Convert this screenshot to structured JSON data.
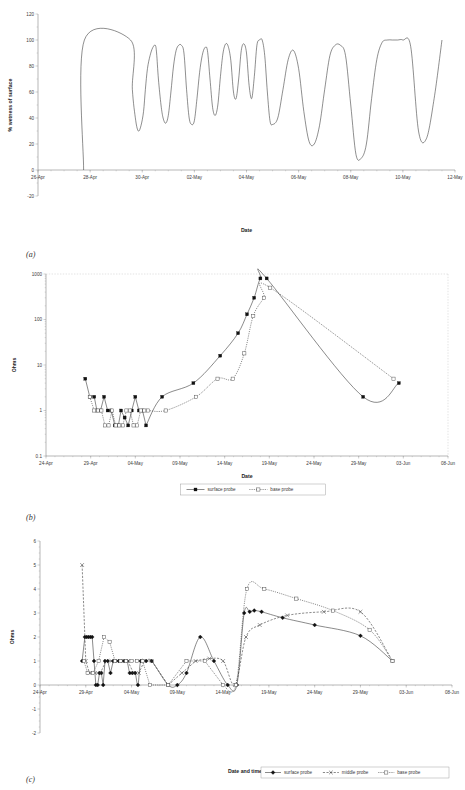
{
  "figure": {
    "panel_a_tag": "(a)",
    "panel_b_tag": "(b)",
    "panel_c_tag": "(c)"
  },
  "chart_data": [
    {
      "id": "a",
      "type": "line",
      "title": "",
      "xlabel": "Date",
      "ylabel": "% wetness of surface",
      "ylim": [
        -20,
        120
      ],
      "yticks": [
        -20,
        0,
        20,
        40,
        60,
        80,
        100,
        120
      ],
      "xticks": [
        "26-Apr",
        "28-Apr",
        "30-Apr",
        "02-May",
        "04-May",
        "06-May",
        "08-May",
        "10-May",
        "12-May"
      ],
      "xlim": [
        "26-Apr",
        "12-May"
      ],
      "grid": false,
      "legend": null,
      "series": [
        {
          "name": "% wetness of surface",
          "note": "continuous high-frequency trace; diurnal wet/dry cycling between 100% and 8-50% minima",
          "x": [
            27.75,
            27.78,
            29.55,
            29.62,
            29.75,
            29.85,
            29.95,
            30.05,
            30.12,
            30.2,
            30.3,
            30.4,
            30.5,
            30.55,
            30.62,
            30.72,
            30.8,
            30.9,
            31.0,
            31.1,
            31.2,
            31.3,
            31.4,
            31.5,
            31.6,
            31.7,
            31.8,
            31.9,
            32.0,
            32.1,
            32.2,
            32.3,
            32.4,
            32.5,
            32.6,
            32.7,
            32.8,
            32.9,
            33.0,
            33.1,
            33.2,
            33.3,
            33.4,
            33.5,
            33.6,
            33.7,
            33.8,
            33.9,
            34.0,
            34.1,
            34.2,
            34.3,
            34.4,
            34.5,
            34.6,
            34.7,
            34.8,
            34.9,
            35.0,
            35.2,
            35.4,
            35.6,
            35.8,
            36.0,
            36.2,
            36.4,
            36.6,
            36.8,
            37.0,
            37.2,
            37.4,
            37.6,
            37.8,
            38.0,
            38.2,
            38.4,
            38.6,
            38.8,
            39.0,
            39.2,
            39.4,
            39.6,
            39.8,
            40.0,
            40.3,
            40.6,
            40.9,
            41.2,
            41.5
          ],
          "y": [
            0,
            100,
            100,
            62,
            38,
            30,
            34,
            45,
            62,
            78,
            88,
            94,
            96,
            90,
            70,
            50,
            40,
            36,
            42,
            60,
            80,
            92,
            96,
            96,
            90,
            62,
            40,
            35,
            38,
            55,
            75,
            88,
            94,
            92,
            70,
            48,
            42,
            50,
            72,
            90,
            97,
            95,
            84,
            60,
            55,
            70,
            92,
            97,
            90,
            65,
            55,
            72,
            96,
            100,
            100,
            88,
            60,
            38,
            35,
            40,
            62,
            85,
            92,
            78,
            45,
            22,
            20,
            34,
            62,
            88,
            96,
            96,
            88,
            50,
            12,
            9,
            20,
            55,
            85,
            98,
            100,
            100,
            100,
            100,
            95,
            30,
            24,
            55,
            100
          ]
        }
      ]
    },
    {
      "id": "b",
      "type": "line",
      "title": "",
      "xlabel": "Date",
      "ylabel": "Ohms",
      "yscale": "log",
      "ylim": [
        0.1,
        1000
      ],
      "yticks": [
        0.1,
        1,
        10,
        100,
        1000
      ],
      "xticks": [
        "24-Apr",
        "29-Apr",
        "04-May",
        "09-May",
        "14-May",
        "19-May",
        "24-May",
        "29-May",
        "03-Jun",
        "08-Jun"
      ],
      "grid": true,
      "legend": {
        "position": "bottom",
        "entries": [
          "surface probe",
          "base probe"
        ]
      },
      "series": [
        {
          "name": "surface probe",
          "marker": "filled-square",
          "linestyle": "solid",
          "x": [
            28.4,
            28.9,
            29.4,
            29.7,
            30.1,
            30.5,
            30.9,
            31.3,
            31.7,
            32.1,
            32.4,
            32.8,
            33.2,
            33.6,
            34.0,
            34.4,
            34.8,
            35.2,
            37.0,
            40.5,
            43.5,
            45.5,
            46.5,
            47.3,
            48.0,
            48.7,
            59.5,
            63.5
          ],
          "y": [
            5,
            2,
            2,
            1,
            1,
            2,
            1,
            1,
            0.47,
            0.47,
            1,
            0.7,
            0.47,
            1,
            2,
            1,
            1,
            0.47,
            2,
            4,
            16,
            50,
            130,
            300,
            800,
            800,
            2,
            4
          ]
        },
        {
          "name": "base probe",
          "marker": "open-square",
          "linestyle": "dotted",
          "x": [
            28.9,
            29.4,
            29.8,
            30.2,
            30.6,
            31.0,
            31.4,
            31.8,
            32.2,
            32.6,
            33.0,
            33.4,
            33.8,
            34.2,
            34.6,
            35.0,
            35.4,
            37.4,
            40.8,
            43.2,
            44.9,
            46.2,
            47.2,
            48.4,
            49.1,
            62.9
          ],
          "y": [
            2,
            1,
            1,
            1,
            0.47,
            0.47,
            1,
            0.47,
            0.47,
            0.47,
            1,
            1,
            0.47,
            0.47,
            1,
            1,
            1,
            1,
            2,
            5,
            5,
            18,
            120,
            300,
            500,
            5
          ]
        }
      ]
    },
    {
      "id": "c",
      "type": "line",
      "title": "",
      "xlabel": "Date and time",
      "ylabel": "Ohms",
      "ylim": [
        -2,
        6
      ],
      "yticks": [
        -2,
        -1,
        0,
        1,
        2,
        3,
        4,
        5,
        6
      ],
      "xticks": [
        "24-Apr",
        "29-Apr",
        "04-May",
        "09-May",
        "14-May",
        "19-May",
        "24-May",
        "29-May",
        "03-Jun",
        "08-Jun"
      ],
      "grid": false,
      "legend": {
        "position": "bottom-right",
        "entries": [
          "surface probe",
          "middle probe",
          "base probe"
        ]
      },
      "series": [
        {
          "name": "surface probe",
          "marker": "filled-diamond",
          "linestyle": "solid",
          "x": [
            28.6,
            28.9,
            29.1,
            29.3,
            29.5,
            29.7,
            29.9,
            30.1,
            30.3,
            30.5,
            30.7,
            30.9,
            31.1,
            31.4,
            31.7,
            32.0,
            32.3,
            32.6,
            32.9,
            33.2,
            33.5,
            33.8,
            34.1,
            34.4,
            34.7,
            35.0,
            35.6,
            36.2,
            38.0,
            39.0,
            40.0,
            41.5,
            43.0,
            44.5,
            45.5,
            46.3,
            46.9,
            47.4,
            48.2,
            50.5,
            54.0,
            59.0,
            62.5
          ],
          "y": [
            1,
            2,
            2,
            2,
            2,
            2,
            1,
            0,
            0,
            0.5,
            0.5,
            0,
            1,
            1,
            0.5,
            1,
            1,
            1,
            1,
            1,
            1,
            0.5,
            0.5,
            0.5,
            0,
            1,
            1,
            1,
            0,
            0,
            0.5,
            2,
            1,
            0,
            0,
            3,
            3.05,
            3.1,
            3.05,
            2.8,
            2.5,
            2.05,
            1
          ]
        },
        {
          "name": "middle probe",
          "marker": "x",
          "linestyle": "dashed",
          "x": [
            28.6,
            29.0,
            29.4,
            30.0,
            30.6,
            31.2,
            31.8,
            32.4,
            33.0,
            33.6,
            34.2,
            34.8,
            35.4,
            36.2,
            38.0,
            39.5,
            41.0,
            42.5,
            44.0,
            45.3,
            46.5,
            48.0,
            51.0,
            55.0,
            59.0,
            62.5
          ],
          "y": [
            5,
            1,
            0.5,
            0.5,
            0.5,
            1,
            1,
            1,
            1,
            1,
            0.5,
            0.5,
            1,
            1,
            0,
            0.5,
            1,
            1.1,
            1,
            0,
            2.0,
            2.5,
            2.9,
            3.05,
            3.05,
            1
          ]
        },
        {
          "name": "base probe",
          "marker": "open-square",
          "linestyle": "dotted",
          "x": [
            28.8,
            29.2,
            29.8,
            30.4,
            31.0,
            31.6,
            32.2,
            32.8,
            33.4,
            34.0,
            34.6,
            35.2,
            36.0,
            38.0,
            40.0,
            42.0,
            44.0,
            45.4,
            46.6,
            48.5,
            52.0,
            56.0,
            60.0,
            62.5
          ],
          "y": [
            1,
            0.5,
            0.5,
            1,
            2,
            1.8,
            1,
            1,
            1,
            1,
            1,
            1,
            0,
            0,
            1,
            1,
            0,
            0,
            4.0,
            4.0,
            3.6,
            3.1,
            2.3,
            1
          ]
        }
      ]
    }
  ]
}
